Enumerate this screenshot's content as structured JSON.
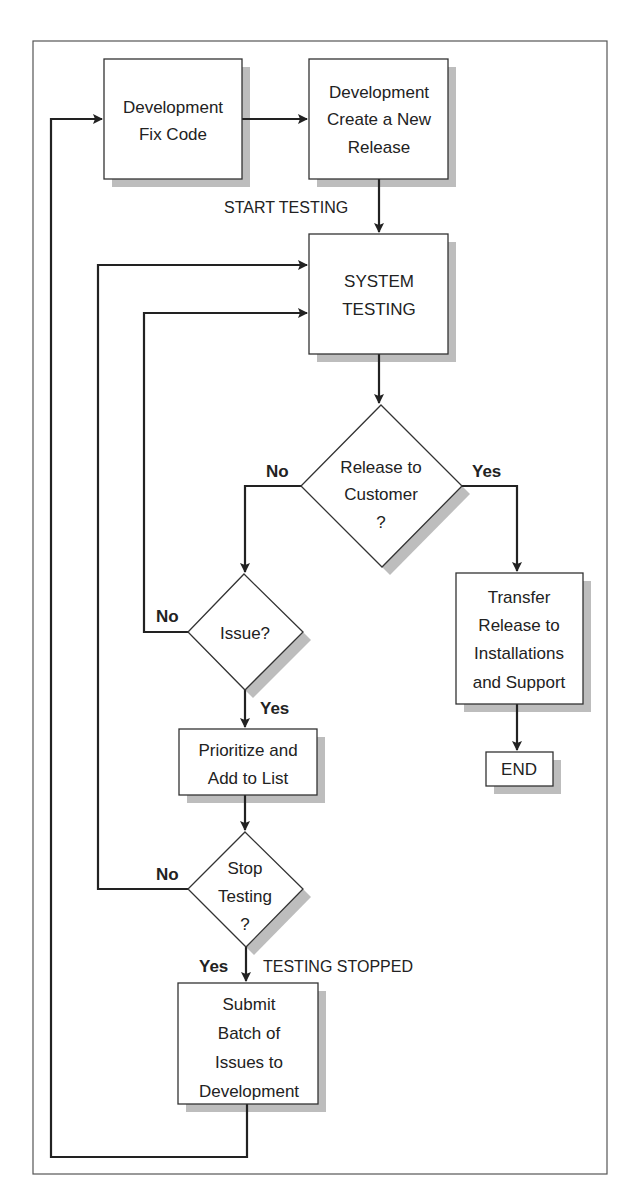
{
  "diagram": {
    "type": "flowchart",
    "colors": {
      "line": "#222222",
      "shadow": "#bdbdbd",
      "fill": "#ffffff",
      "frame": "#555555"
    },
    "nodes": {
      "fix_code": {
        "shape": "box",
        "lines": [
          "Development",
          "Fix Code"
        ]
      },
      "new_release": {
        "shape": "box",
        "lines": [
          "Development",
          "Create a New",
          "Release"
        ]
      },
      "system_testing": {
        "shape": "box",
        "lines": [
          "SYSTEM",
          "TESTING"
        ]
      },
      "release_to_customer": {
        "shape": "decision",
        "lines": [
          "Release to",
          "Customer",
          "?"
        ]
      },
      "transfer": {
        "shape": "box",
        "lines": [
          "Transfer",
          "Release to",
          "Installations",
          "and Support"
        ]
      },
      "end": {
        "shape": "box",
        "lines": [
          "END"
        ]
      },
      "issue": {
        "shape": "decision",
        "lines": [
          "Issue?"
        ]
      },
      "prioritize": {
        "shape": "box",
        "lines": [
          "Prioritize and",
          "Add to List"
        ]
      },
      "stop_testing": {
        "shape": "decision",
        "lines": [
          "Stop",
          "Testing",
          "?"
        ]
      },
      "submit": {
        "shape": "box",
        "lines": [
          "Submit",
          "Batch of",
          "Issues to",
          "Development"
        ]
      }
    },
    "edge_labels": {
      "start_testing": "START TESTING",
      "release_no": "No",
      "release_yes": "Yes",
      "issue_no": "No",
      "issue_yes": "Yes",
      "stop_no": "No",
      "stop_yes": "Yes",
      "testing_stopped": "TESTING STOPPED"
    }
  }
}
